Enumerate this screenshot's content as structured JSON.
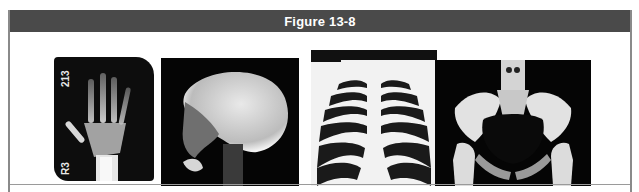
{
  "figure": {
    "title": "Figure 13-8",
    "header_color": "#4a4a4a",
    "images": [
      {
        "id": "hand",
        "label": "Hand X-ray",
        "annotations": [
          "213",
          "R3"
        ]
      },
      {
        "id": "skull",
        "label": "Skull X-ray (lateral)"
      },
      {
        "id": "chest",
        "label": "Chest X-ray"
      },
      {
        "id": "pelvis",
        "label": "Pelvis X-ray"
      }
    ]
  }
}
